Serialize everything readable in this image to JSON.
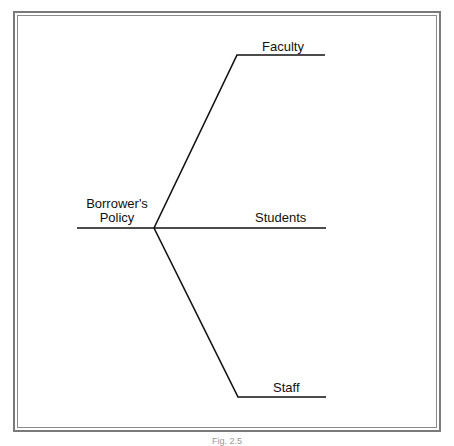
{
  "diagram": {
    "type": "tree",
    "root": {
      "label_line1": "Borrower's",
      "label_line2": "Policy"
    },
    "branches": [
      {
        "label": "Faculty"
      },
      {
        "label": "Students"
      },
      {
        "label": "Staff"
      }
    ],
    "line_color": "#111111",
    "frame_color": "#7a7a7a"
  },
  "caption": "Fig. 2.5"
}
